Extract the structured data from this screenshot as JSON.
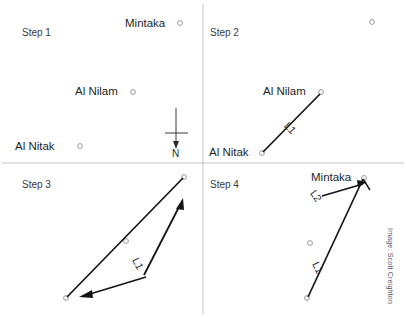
{
  "figure": {
    "width": 406,
    "height": 318,
    "background": "#ffffff",
    "line_color": "#1a1a1a",
    "divider_color": "#bdbdbd",
    "star_marker_color": "#8f8f8f",
    "credit": "Image: Scott Creighton"
  },
  "panels": [
    {
      "id": "step1",
      "label": "Step 1",
      "stars": [
        {
          "name": "Mintaka",
          "label": "Mintaka",
          "x": 180,
          "y": 23
        },
        {
          "name": "Al Nilam",
          "label": "Al Nilam",
          "x": 133,
          "y": 92
        },
        {
          "name": "Al Nitak",
          "label": "Al Nitak",
          "x": 80,
          "y": 146
        }
      ],
      "compass": {
        "label": "N",
        "direction": "south-arrow"
      }
    },
    {
      "id": "step2",
      "label": "Step 2",
      "stars": [
        {
          "name": "Mintaka",
          "label": "",
          "x": 372,
          "y": 22
        },
        {
          "name": "Al Nilam",
          "label": "Al Nilam",
          "x": 321,
          "y": 92
        },
        {
          "name": "Al Nitak",
          "label": "Al Nitak",
          "x": 262,
          "y": 153
        }
      ],
      "segments": [
        {
          "name": "L1",
          "label": "L1",
          "from": "Al Nitak",
          "to": "Al Nilam"
        }
      ]
    },
    {
      "id": "step3",
      "label": "Step 3",
      "stars": [
        {
          "name": "Mintaka",
          "label": "",
          "x": 184,
          "y": 177
        },
        {
          "name": "Al Nilam",
          "label": "",
          "x": 126,
          "y": 241
        },
        {
          "name": "Al Nitak",
          "label": "",
          "x": 66,
          "y": 298
        }
      ],
      "segments": [
        {
          "name": "L1",
          "label": "L1",
          "from": "Al Nitak",
          "to": "Mintaka",
          "measure": "double-arrow"
        }
      ]
    },
    {
      "id": "step4",
      "label": "Step 4",
      "stars": [
        {
          "name": "Mintaka",
          "label": "Mintaka",
          "x": 364,
          "y": 178
        },
        {
          "name": "Al Nilam",
          "label": "",
          "x": 310,
          "y": 243
        },
        {
          "name": "Al Nitak",
          "label": "",
          "x": 307,
          "y": 298
        }
      ],
      "segments": [
        {
          "name": "L1",
          "label": "L1",
          "from": "Al Nitak",
          "to": "Al Nilam"
        },
        {
          "name": "L2",
          "label": "L2",
          "from": "Al Nilam",
          "to": "Mintaka",
          "measure": "arrow"
        }
      ]
    }
  ]
}
